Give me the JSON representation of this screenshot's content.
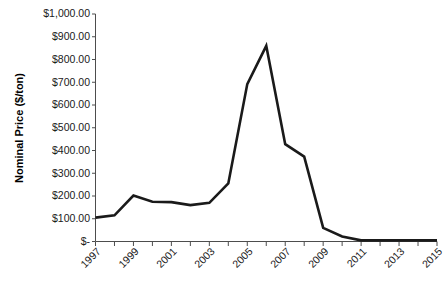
{
  "chart_data": {
    "type": "line",
    "title": "",
    "xlabel": "",
    "ylabel": "Nominal Price ($/ton)",
    "ylim": [
      0,
      1000
    ],
    "xlim": [
      1997,
      2015
    ],
    "grid": false,
    "legend": null,
    "line_color": "#1a1a1a",
    "axis_color": "#4d4d4d",
    "x": [
      1997,
      1998,
      1999,
      2000,
      2001,
      2002,
      2003,
      2004,
      2005,
      2006,
      2007,
      2008,
      2009,
      2010,
      2011,
      2012,
      2013,
      2014,
      2015
    ],
    "series": [
      {
        "name": "Nominal Price",
        "values": [
          105,
          115,
          202,
          175,
          173,
          160,
          170,
          255,
          692,
          860,
          428,
          373,
          60,
          22,
          5,
          5,
          5,
          5,
          5
        ]
      }
    ],
    "ytick_values": [
      0,
      100,
      200,
      300,
      400,
      500,
      600,
      700,
      800,
      900,
      1000
    ],
    "ytick_labels": [
      "$-",
      "$100.00",
      "$200.00",
      "$300.00",
      "$400.00",
      "$500.00",
      "$600.00",
      "$700.00",
      "$800.00",
      "$900.00",
      "$1,000.00"
    ],
    "xtick_values": [
      1997,
      1998,
      1999,
      2000,
      2001,
      2002,
      2003,
      2004,
      2005,
      2006,
      2007,
      2008,
      2009,
      2010,
      2011,
      2012,
      2013,
      2014,
      2015
    ],
    "xtick_labels": [
      "1997",
      "",
      "1999",
      "",
      "2001",
      "",
      "2003",
      "",
      "2005",
      "",
      "2007",
      "",
      "2009",
      "",
      "2011",
      "",
      "2013",
      "",
      "2015"
    ]
  }
}
